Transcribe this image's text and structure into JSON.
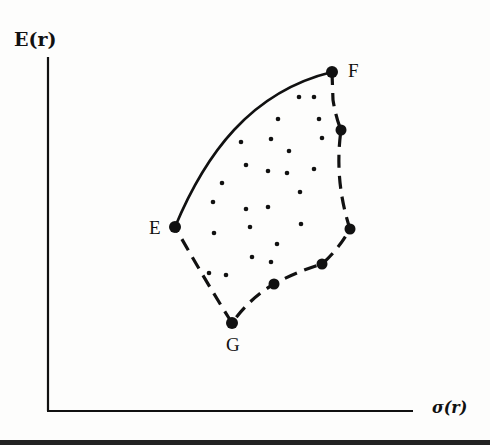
{
  "chart_data": {
    "type": "scatter",
    "title": "",
    "xlabel": "σ(r)",
    "ylabel": "E(r)",
    "grid": false,
    "legend": null,
    "axis_ticks": "none",
    "points_labeled": [
      {
        "label": "E",
        "x": 175,
        "y": 227,
        "note": "minimum-variance end of efficient frontier"
      },
      {
        "label": "F",
        "x": 332,
        "y": 72,
        "note": "maximum-return point"
      },
      {
        "label": "G",
        "x": 232,
        "y": 323,
        "note": "minimum-return point"
      }
    ],
    "frontier_markers": [
      {
        "x": 341,
        "y": 130
      },
      {
        "x": 350,
        "y": 229
      },
      {
        "x": 322,
        "y": 264
      },
      {
        "x": 274,
        "y": 284
      }
    ],
    "efficient_frontier": {
      "style": "solid",
      "from": "E",
      "to": "F"
    },
    "boundary_dashed": {
      "style": "dashed",
      "path": [
        "F",
        "right-upper marker",
        "right marker",
        "lower-right marker",
        "lower marker",
        "G",
        "E"
      ]
    },
    "interior_points": [
      [
        299,
        97
      ],
      [
        314,
        97
      ],
      [
        278,
        119
      ],
      [
        319,
        119
      ],
      [
        241,
        142
      ],
      [
        271,
        139
      ],
      [
        322,
        138
      ],
      [
        289,
        151
      ],
      [
        246,
        165
      ],
      [
        268,
        171
      ],
      [
        287,
        173
      ],
      [
        314,
        169
      ],
      [
        222,
        183
      ],
      [
        300,
        192
      ],
      [
        213,
        202
      ],
      [
        246,
        209
      ],
      [
        268,
        207
      ],
      [
        250,
        227
      ],
      [
        214,
        233
      ],
      [
        301,
        224
      ],
      [
        277,
        244
      ],
      [
        252,
        257
      ],
      [
        271,
        262
      ],
      [
        209,
        273
      ],
      [
        226,
        275
      ]
    ],
    "note": "Coordinates are in screenshot pixel space; axes have no numeric scale."
  },
  "labels": {
    "y_axis": "E(r)",
    "x_axis": "σ(r)",
    "point_E": "E",
    "point_F": "F",
    "point_G": "G"
  },
  "colors": {
    "ink": "#111111",
    "background": "#fdfdfc"
  }
}
